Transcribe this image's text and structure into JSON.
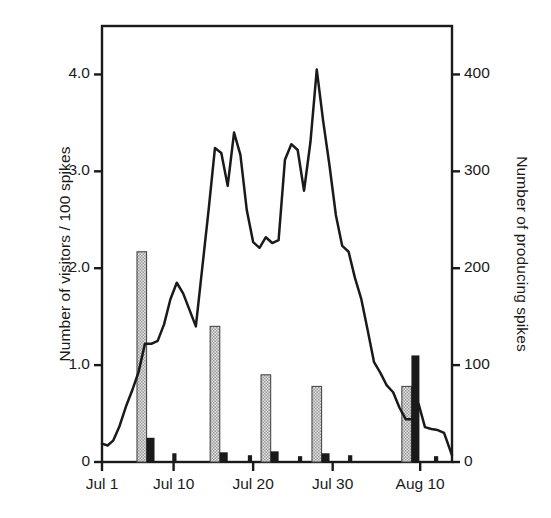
{
  "chart_data": {
    "type": "line",
    "title": "",
    "subtitle": "",
    "xlabel": "",
    "ylabel": "Number of visitors / 100 spikes",
    "y2label": "Number of producing spikes",
    "grid": false,
    "legend": "none",
    "xlim": [
      0,
      44
    ],
    "ylim": [
      0,
      4.5
    ],
    "y2lim": [
      0,
      450
    ],
    "x_tick_labels": [
      "Jul 1",
      "Jul 10",
      "Jul 20",
      "Jul 30",
      "Aug 10"
    ],
    "x_tick_values": [
      0,
      9,
      19,
      29,
      40
    ],
    "y_tick_labels": [
      "0",
      "1.0",
      "2.0",
      "3.0",
      "4.0"
    ],
    "y_tick_values": [
      0,
      1.0,
      2.0,
      3.0,
      4.0
    ],
    "y2_tick_labels": [
      "0",
      "100",
      "200",
      "300",
      "400"
    ],
    "y2_tick_values": [
      0,
      100,
      200,
      300,
      400
    ],
    "series": [
      {
        "name": "Number of visitors / 100 spikes",
        "type": "line",
        "axis": "left",
        "color": "#1a1a1a",
        "x": [
          0,
          0.7,
          1.4,
          2.2,
          3.0,
          3.8,
          4.6,
          5.4,
          6.2,
          7.0,
          7.8,
          8.6,
          9.4,
          10.2,
          11.0,
          11.8,
          12.6,
          13.4,
          14.2,
          15.0,
          15.8,
          16.6,
          17.4,
          18.2,
          19.0,
          19.8,
          20.6,
          21.4,
          22.2,
          23.0,
          23.8,
          24.6,
          25.4,
          26.2,
          27.0,
          27.8,
          28.6,
          29.4,
          30.2,
          31.0,
          31.8,
          32.6,
          33.4,
          34.2,
          35.0,
          35.8,
          36.6,
          37.4,
          38.2,
          39.0,
          39.8,
          40.6,
          41.4,
          42.2,
          43.0,
          44.0
        ],
        "y": [
          0.19,
          0.17,
          0.22,
          0.37,
          0.57,
          0.74,
          0.93,
          1.22,
          1.22,
          1.25,
          1.42,
          1.68,
          1.85,
          1.74,
          1.57,
          1.4,
          2.0,
          2.6,
          3.24,
          3.19,
          2.85,
          3.4,
          3.17,
          2.6,
          2.27,
          2.21,
          2.32,
          2.26,
          2.29,
          3.12,
          3.28,
          3.22,
          2.8,
          3.3,
          4.05,
          3.52,
          3.06,
          2.55,
          2.23,
          2.17,
          1.9,
          1.68,
          1.36,
          1.03,
          0.92,
          0.79,
          0.72,
          0.56,
          0.44,
          0.44,
          0.6,
          0.36,
          0.34,
          0.33,
          0.3,
          0.07
        ]
      },
      {
        "name": "Number of producing spikes (pale)",
        "type": "bar",
        "axis": "left",
        "style": "hatched-gray",
        "color": "#c8c8c8",
        "x": [
          5.0,
          14.2,
          20.6,
          27.0,
          38.3
        ],
        "values": [
          2.17,
          1.4,
          0.9,
          0.78,
          0.78
        ]
      },
      {
        "name": "Number of producing spikes (dark)",
        "type": "bar",
        "axis": "left",
        "style": "solid-black",
        "color": "#1a1a1a",
        "x": [
          6.1,
          15.3,
          21.7,
          28.1,
          39.4
        ],
        "values": [
          0.25,
          0.1,
          0.11,
          0.09,
          1.1
        ]
      },
      {
        "name": "Minor dark marks",
        "type": "bar",
        "axis": "left",
        "style": "solid-black-thin",
        "color": "#1a1a1a",
        "x": [
          9.1,
          18.6,
          24.9,
          31.2,
          42.0
        ],
        "values": [
          0.09,
          0.07,
          0.06,
          0.07,
          0.06
        ]
      }
    ]
  },
  "axes": {
    "left_title": "Number of visitors / 100 spikes",
    "right_title": "Number of producing spikes"
  }
}
